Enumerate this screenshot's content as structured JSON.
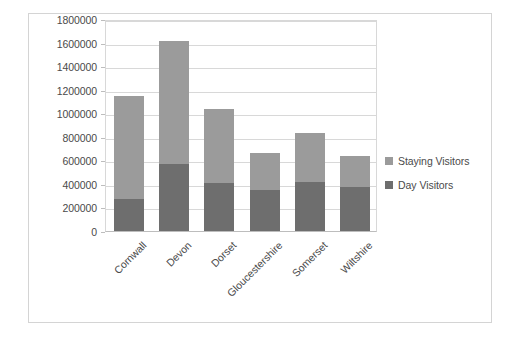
{
  "chart_data": {
    "type": "bar",
    "subtype": "stacked-vertical",
    "title": "",
    "xlabel": "",
    "ylabel": "",
    "grid": true,
    "legend_position": "right",
    "ylim": [
      0,
      1800000
    ],
    "ytick_step": 200000,
    "ytick_labels": [
      "1800000",
      "1600000",
      "1400000",
      "1200000",
      "1000000",
      "800000",
      "600000",
      "400000",
      "200000",
      "0"
    ],
    "ytick_values": [
      1800000,
      1600000,
      1400000,
      1200000,
      1000000,
      800000,
      600000,
      400000,
      200000,
      0
    ],
    "categories": [
      "Cornwall",
      "Devon",
      "Dorset",
      "Gloucestershire",
      "Somerset",
      "Wiltshire"
    ],
    "series": [
      {
        "name": "Day Visitors",
        "color": "#6e6e6e",
        "values": [
          270000,
          570000,
          410000,
          350000,
          420000,
          370000
        ]
      },
      {
        "name": "Staying Visitors",
        "color": "#9b9b9b",
        "values": [
          880000,
          1040000,
          630000,
          310000,
          410000,
          270000
        ]
      }
    ],
    "totals": [
      1150000,
      1610000,
      1040000,
      660000,
      830000,
      640000
    ],
    "legend": [
      {
        "label": "Staying Visitors",
        "color": "#9b9b9b"
      },
      {
        "label": "Day Visitors",
        "color": "#6e6e6e"
      }
    ]
  },
  "colors": {
    "staying_visitors": "#9b9b9b",
    "day_visitors": "#6e6e6e",
    "gridline": "#d8d8d8",
    "axis_text": "#4a4a4a",
    "frame_border": "#d4d4d4"
  }
}
